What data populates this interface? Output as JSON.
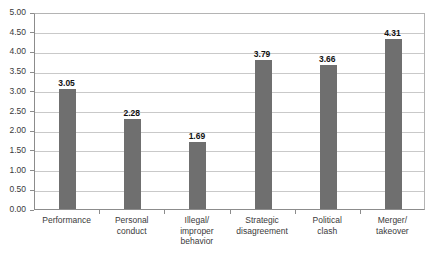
{
  "chart_data": {
    "type": "bar",
    "title": "",
    "subtitle": "",
    "xlabel": "",
    "ylabel": "",
    "ylim": [
      0,
      5
    ],
    "ytick_step": 0.5,
    "grid": true,
    "legend": false,
    "legend_position": "none",
    "bar_color": "#6f6f6f",
    "gridline_color": "#c9c9c9",
    "axis_color": "#8c8c8c",
    "background": "#ffffff",
    "value_label_format": "2-decimals",
    "categories": [
      "Performance",
      "Personal\nconduct",
      "Illegal/\nimproper\nbehavior",
      "Strategic\ndisagreement",
      "Political\nclash",
      "Merger/\ntakeover"
    ],
    "values": [
      3.05,
      2.28,
      1.69,
      3.79,
      3.66,
      4.31
    ],
    "value_labels": [
      "3.05",
      "2.28",
      "1.69",
      "3.79",
      "3.66",
      "4.31"
    ],
    "ytick_labels": [
      "0.00",
      "0.50",
      "1.00",
      "1.50",
      "2.00",
      "2.50",
      "3.00",
      "3.50",
      "4.00",
      "4.50",
      "5.00"
    ],
    "ytick_values": [
      0,
      0.5,
      1,
      1.5,
      2,
      2.5,
      3,
      3.5,
      4,
      4.5,
      5
    ]
  }
}
